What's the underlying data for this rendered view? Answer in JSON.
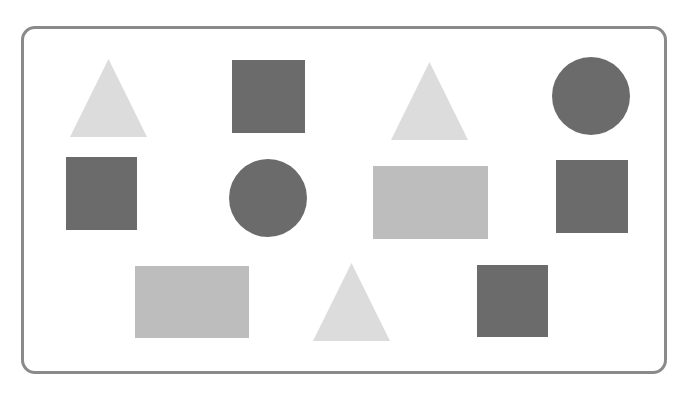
{
  "title": "",
  "colors": {
    "frame_border": "#8a8a8a",
    "background": "#ffffff",
    "triangle": "#dcdcdc",
    "rectangle": "#bdbdbd",
    "square": "#6b6b6b",
    "circle": "#6b6b6b"
  },
  "frame": {
    "x": 21,
    "y": 26,
    "width": 646,
    "height": 348,
    "radius": 14
  },
  "shapes": [
    {
      "id": "triangle-1",
      "type": "triangle",
      "color": "#dcdcdc",
      "x": 70,
      "y": 59,
      "width": 77,
      "height": 78
    },
    {
      "id": "square-1",
      "type": "square",
      "color": "#6b6b6b",
      "x": 232,
      "y": 60,
      "width": 73,
      "height": 73
    },
    {
      "id": "triangle-2",
      "type": "triangle",
      "color": "#dcdcdc",
      "x": 391,
      "y": 62,
      "width": 77,
      "height": 78
    },
    {
      "id": "circle-1",
      "type": "circle",
      "color": "#6b6b6b",
      "x": 552,
      "y": 57,
      "width": 78,
      "height": 78
    },
    {
      "id": "square-2",
      "type": "square",
      "color": "#6b6b6b",
      "x": 66,
      "y": 157,
      "width": 71,
      "height": 73
    },
    {
      "id": "circle-2",
      "type": "circle",
      "color": "#6b6b6b",
      "x": 229,
      "y": 159,
      "width": 78,
      "height": 78
    },
    {
      "id": "rectangle-1",
      "type": "rectangle",
      "color": "#bdbdbd",
      "x": 373,
      "y": 166,
      "width": 115,
      "height": 73
    },
    {
      "id": "square-3",
      "type": "square",
      "color": "#6b6b6b",
      "x": 556,
      "y": 160,
      "width": 72,
      "height": 73
    },
    {
      "id": "rectangle-2",
      "type": "rectangle",
      "color": "#bdbdbd",
      "x": 135,
      "y": 266,
      "width": 114,
      "height": 72
    },
    {
      "id": "triangle-3",
      "type": "triangle",
      "color": "#dcdcdc",
      "x": 313,
      "y": 263,
      "width": 77,
      "height": 78
    },
    {
      "id": "square-4",
      "type": "square",
      "color": "#6b6b6b",
      "x": 477,
      "y": 265,
      "width": 71,
      "height": 72
    }
  ],
  "counts": {
    "triangles": 3,
    "squares": 4,
    "circles": 2,
    "rectangles": 2,
    "total": 11
  }
}
